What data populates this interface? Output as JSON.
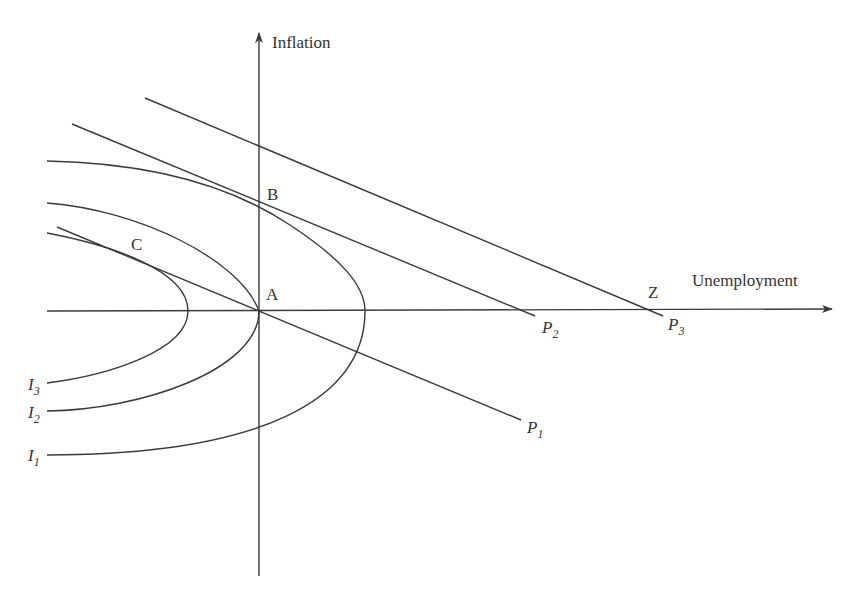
{
  "axes": {
    "y_label": "Inflation",
    "x_label": "Unemployment"
  },
  "points": {
    "A": "A",
    "B": "B",
    "C": "C",
    "Z": "Z"
  },
  "curves": {
    "indifference": [
      {
        "name": "I",
        "sub": "1"
      },
      {
        "name": "I",
        "sub": "2"
      },
      {
        "name": "I",
        "sub": "3"
      }
    ],
    "phillips": [
      {
        "name": "P",
        "sub": "1"
      },
      {
        "name": "P",
        "sub": "2"
      },
      {
        "name": "P",
        "sub": "3"
      }
    ]
  },
  "colors": {
    "line": "#3a3a3a",
    "text": "#333333",
    "background": "#ffffff"
  }
}
